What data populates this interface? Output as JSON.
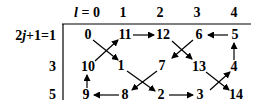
{
  "header": {
    "l_label": "l = 0",
    "columns": [
      "1",
      "2",
      "3",
      "4"
    ]
  },
  "rows": [
    {
      "label": "2j+1=1",
      "values": [
        "0",
        "11",
        "12",
        "6",
        "5"
      ]
    },
    {
      "label": "3",
      "values": [
        "10",
        "1",
        "7",
        "13",
        "4"
      ]
    },
    {
      "label": "5",
      "values": [
        "9",
        "8",
        "2",
        "3",
        "14"
      ]
    }
  ],
  "edges": [
    {
      "from": "0",
      "to": "1"
    },
    {
      "from": "1",
      "to": "2"
    },
    {
      "from": "2",
      "to": "3"
    },
    {
      "from": "3",
      "to": "4"
    },
    {
      "from": "4",
      "to": "5"
    },
    {
      "from": "5",
      "to": "6"
    },
    {
      "from": "6",
      "to": "7"
    },
    {
      "from": "7",
      "to": "8"
    },
    {
      "from": "8",
      "to": "9"
    },
    {
      "from": "9",
      "to": "10"
    },
    {
      "from": "10",
      "to": "11"
    },
    {
      "from": "11",
      "to": "12"
    },
    {
      "from": "12",
      "to": "13"
    },
    {
      "from": "13",
      "to": "14"
    }
  ],
  "colors": {
    "ink": "#000000",
    "background": "#ffffff"
  }
}
